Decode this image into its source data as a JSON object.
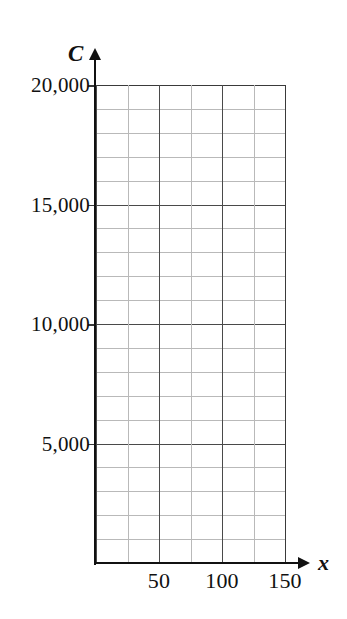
{
  "figure": {
    "background_color": "#ffffff",
    "axis_color": "#111111",
    "major_grid_color": "#4a4a4a",
    "minor_grid_color": "#b9b9b9"
  },
  "chart_data": {
    "type": "line",
    "title": "",
    "subtitle": "",
    "xlabel": "x",
    "ylabel": "C",
    "xlim": [
      0,
      180
    ],
    "ylim": [
      0,
      20000
    ],
    "grid": true,
    "legend": null,
    "annotations": [],
    "series": [],
    "x_ticks": [
      {
        "value": 50,
        "label": "50"
      },
      {
        "value": 100,
        "label": "100"
      },
      {
        "value": 150,
        "label": "150"
      }
    ],
    "y_ticks": [
      {
        "value": 5000,
        "label": "5,000"
      },
      {
        "value": 10000,
        "label": "10,000"
      },
      {
        "value": 15000,
        "label": "15,000"
      },
      {
        "value": 20000,
        "label": "20,000"
      }
    ],
    "x_major_step": 50,
    "x_minor_step": 25,
    "y_major_step": 5000,
    "y_minor_step": 1000,
    "plot_x_max": 150,
    "plot_y_max": 20000,
    "minor_columns": 6,
    "minor_rows": 20
  },
  "axes": {
    "y_name": "C",
    "x_name": "x"
  },
  "y_tick_labels": [
    "20,000",
    "15,000",
    "10,000",
    "5,000"
  ],
  "x_tick_labels": [
    "50",
    "100",
    "150"
  ]
}
